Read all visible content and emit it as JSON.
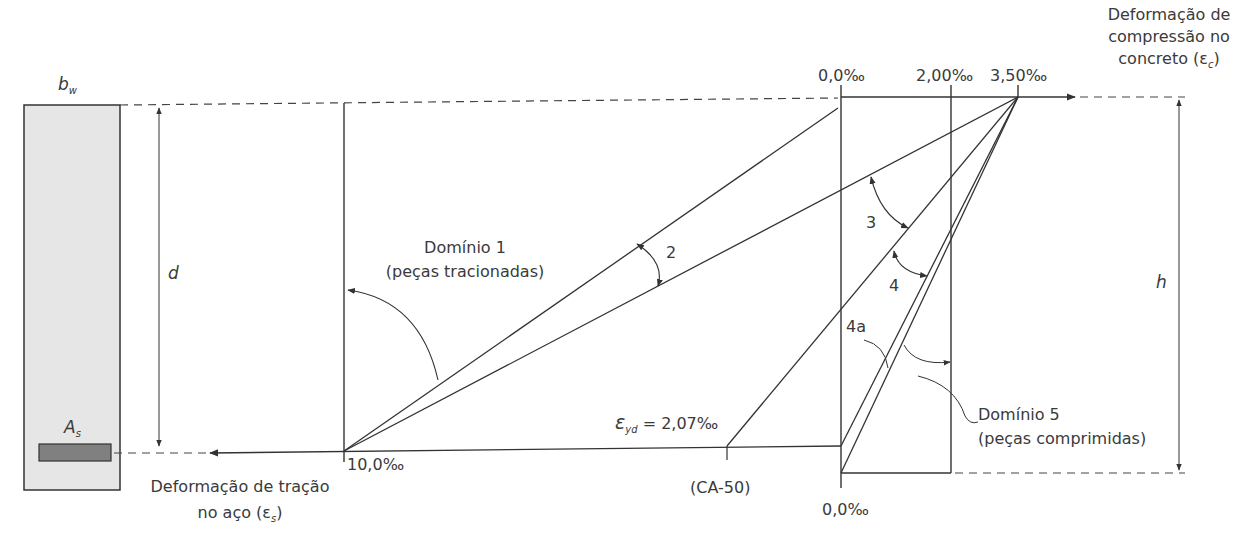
{
  "section": {
    "width_label": "b",
    "width_sub": "w",
    "depth_label": "d",
    "steel_label": "A",
    "steel_sub": "s",
    "height_label": "h"
  },
  "axes": {
    "compression_title_line1": "Deformação de",
    "compression_title_line2": "compressão no",
    "compression_title_line3": "concreto (ε",
    "compression_title_sub": "c",
    "compression_title_end": ")",
    "tension_title_line1": "Deformação de tração",
    "tension_title_line2": "no aço (ε",
    "tension_title_sub": "s",
    "tension_title_end": ")"
  },
  "ticks": {
    "top_zero": "0,0‰",
    "top_200": "2,00‰",
    "top_350": "3,50‰",
    "steel_10": "10,0‰",
    "bottom_zero": "0,0‰",
    "eyd_symbol": "ε",
    "eyd_sub": "yd",
    "eyd_value": " = 2,07‰",
    "ca50": "(CA-50)"
  },
  "domains": {
    "d1_title": "Domínio 1",
    "d1_sub": "(peças tracionadas)",
    "d2": "2",
    "d3": "3",
    "d4": "4",
    "d4a": "4a",
    "d5_title": "Domínio 5",
    "d5_sub": "(peças comprimidas)"
  },
  "colors": {
    "line": "#333333",
    "section_fill": "#e6e6e6",
    "steel_fill": "#808080"
  }
}
